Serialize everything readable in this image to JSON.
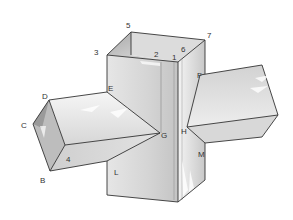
{
  "diagram": {
    "colors": {
      "background": "#ffffff",
      "edge": "#333333",
      "face_light": "#f2f2f2",
      "face_mid": "#d9d9d9",
      "face_dark": "#b8b8b8"
    },
    "labels": {
      "five": "5",
      "seven": "7",
      "three": "3",
      "two": "2",
      "one": "1",
      "six": "6",
      "d": "D",
      "c": "C",
      "b": "B",
      "e": "E",
      "g": "G",
      "four": "4",
      "l": "L",
      "f": "F",
      "h": "H",
      "m": "M"
    }
  }
}
